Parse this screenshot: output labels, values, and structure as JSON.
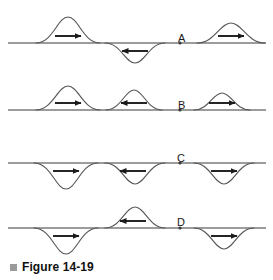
{
  "figure": {
    "caption_text": "Figure 14-19",
    "caption_bullet": "square-bullet-icon",
    "background_color": "#ffffff",
    "line_color": "#3a3a3a",
    "curve_color": "#555555",
    "arrow_color": "#1a1a1a",
    "label_color": "#1a1a1a",
    "caption_bullet_color": "#9a9a9a"
  },
  "rows": [
    {
      "label": "A",
      "label_x": 178,
      "label_y": 33,
      "baseline_y": 43,
      "marker_x": 180,
      "pulses": [
        {
          "name": "pulse-a-1",
          "center_x": 68,
          "half_width": 32,
          "amplitude": 26,
          "orientation": "up",
          "direction": "right",
          "arrow_x": 68,
          "arrow_y": 36,
          "arrow_len": 26
        },
        {
          "name": "pulse-a-2",
          "center_x": 135,
          "half_width": 30,
          "amplitude": 20,
          "orientation": "down",
          "direction": "left",
          "arrow_x": 135,
          "arrow_y": 51,
          "arrow_len": 26
        },
        {
          "name": "pulse-a-3",
          "center_x": 231,
          "half_width": 34,
          "amplitude": 20,
          "orientation": "up",
          "direction": "right",
          "arrow_x": 231,
          "arrow_y": 36,
          "arrow_len": 26
        }
      ]
    },
    {
      "label": "B",
      "label_x": 178,
      "label_y": 100,
      "baseline_y": 110,
      "marker_x": 180,
      "pulses": [
        {
          "name": "pulse-b-1",
          "center_x": 68,
          "half_width": 32,
          "amplitude": 24,
          "orientation": "up",
          "direction": "right",
          "arrow_x": 68,
          "arrow_y": 103,
          "arrow_len": 26
        },
        {
          "name": "pulse-b-2",
          "center_x": 134,
          "half_width": 28,
          "amplitude": 20,
          "orientation": "up",
          "direction": "left",
          "arrow_x": 134,
          "arrow_y": 103,
          "arrow_len": 26
        },
        {
          "name": "pulse-b-3",
          "center_x": 222,
          "half_width": 28,
          "amplitude": 17,
          "orientation": "up",
          "direction": "right",
          "arrow_x": 222,
          "arrow_y": 103,
          "arrow_len": 26
        }
      ]
    },
    {
      "label": "C",
      "label_x": 177,
      "label_y": 153,
      "baseline_y": 163,
      "marker_x": 180,
      "pulses": [
        {
          "name": "pulse-c-1",
          "center_x": 66,
          "half_width": 32,
          "amplitude": 26,
          "orientation": "down",
          "direction": "right",
          "arrow_x": 66,
          "arrow_y": 171,
          "arrow_len": 26
        },
        {
          "name": "pulse-c-2",
          "center_x": 135,
          "half_width": 30,
          "amplitude": 21,
          "orientation": "down",
          "direction": "left",
          "arrow_x": 133,
          "arrow_y": 171,
          "arrow_len": 26
        },
        {
          "name": "pulse-c-3",
          "center_x": 224,
          "half_width": 30,
          "amplitude": 21,
          "orientation": "down",
          "direction": "right",
          "arrow_x": 224,
          "arrow_y": 171,
          "arrow_len": 26
        }
      ]
    },
    {
      "label": "D",
      "label_x": 177,
      "label_y": 217,
      "baseline_y": 228,
      "marker_x": 180,
      "pulses": [
        {
          "name": "pulse-d-1",
          "center_x": 66,
          "half_width": 32,
          "amplitude": 26,
          "orientation": "down",
          "direction": "right",
          "arrow_x": 66,
          "arrow_y": 236,
          "arrow_len": 26
        },
        {
          "name": "pulse-d-2",
          "center_x": 135,
          "half_width": 30,
          "amplitude": 21,
          "orientation": "up",
          "direction": "left",
          "arrow_x": 133,
          "arrow_y": 221,
          "arrow_len": 26
        },
        {
          "name": "pulse-d-3",
          "center_x": 224,
          "half_width": 30,
          "amplitude": 21,
          "orientation": "down",
          "direction": "right",
          "arrow_x": 224,
          "arrow_y": 236,
          "arrow_len": 26
        }
      ]
    }
  ]
}
